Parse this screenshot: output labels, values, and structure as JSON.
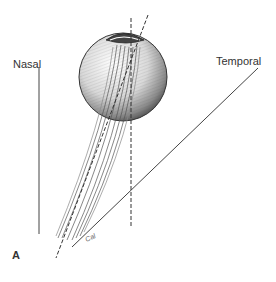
{
  "figure": {
    "panel_label": "A",
    "labels": {
      "nasal": "Nasal",
      "temporal": "Temporal"
    },
    "signature": "Cal",
    "colors": {
      "ink": "#333333",
      "background": "#ffffff"
    },
    "elements": [
      "eyeball-sphere",
      "cornea-cap",
      "optic-nerve-bundle",
      "visual-axis-dashed-line",
      "vertical-dashed-line",
      "nasal-reference-line",
      "temporal-reference-line"
    ]
  }
}
